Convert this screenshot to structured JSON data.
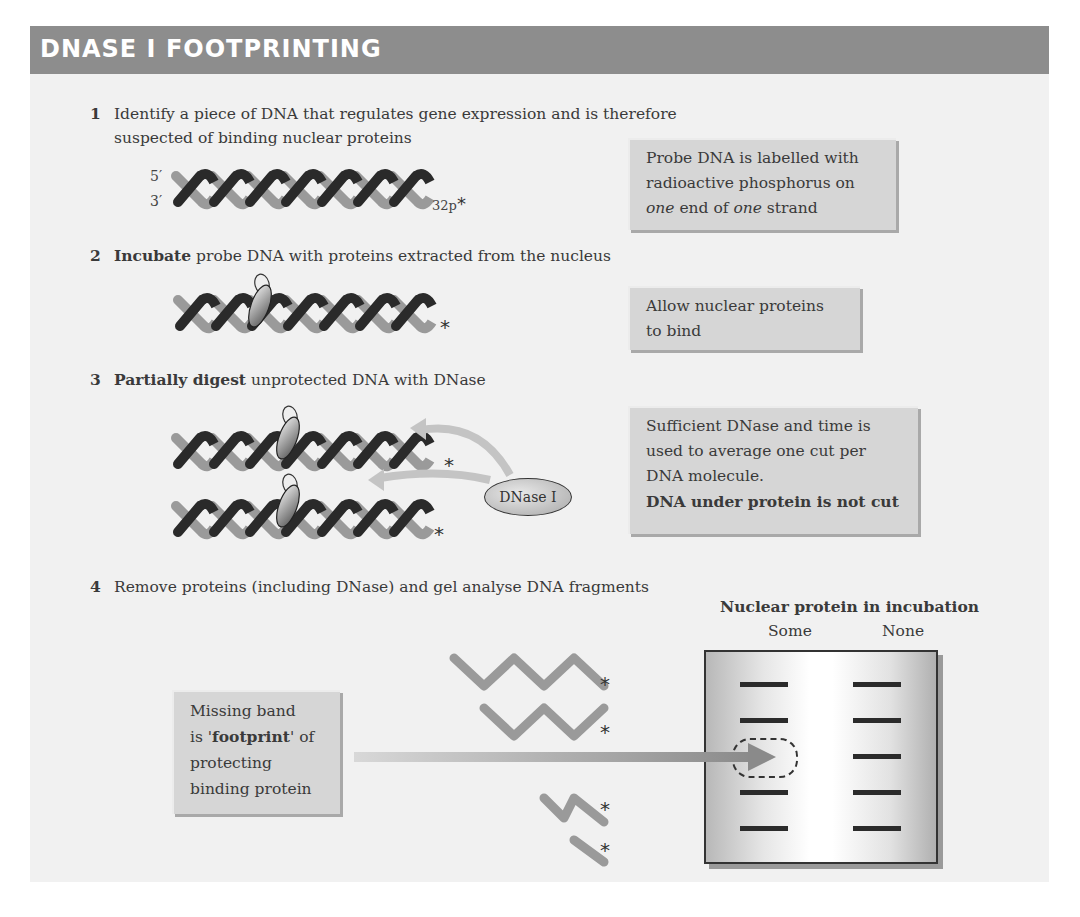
{
  "title": "DNASE I FOOTPRINTING",
  "steps": [
    {
      "num": "1",
      "bold": "",
      "text_line1": "Identify a piece of DNA that regulates gene expression and is therefore",
      "text_line2": "suspected of binding nuclear proteins"
    },
    {
      "num": "2",
      "bold": "Incubate",
      "text": " probe DNA with proteins extracted from the nucleus"
    },
    {
      "num": "3",
      "bold": "Partially digest",
      "text": " unprotected DNA with DNase"
    },
    {
      "num": "4",
      "bold": "",
      "text": "Remove proteins (including DNase) and gel analyse DNA fragments"
    }
  ],
  "notes": {
    "probe": {
      "line1": "Probe DNA is labelled with",
      "line2": "radioactive phosphorus on",
      "line3_italic_a": "one",
      "line3_mid": " end of ",
      "line3_italic_b": "one",
      "line3_end": " strand"
    },
    "bind": {
      "line1": "Allow nuclear proteins",
      "line2": "to bind"
    },
    "dnase": {
      "line1": "Sufficient DNase and time is",
      "line2": "used to average one cut per",
      "line3": "DNA molecule.",
      "line4_bold": "DNA under protein is not cut"
    },
    "footprint": {
      "line1": "Missing band",
      "line2_pre": "is '",
      "line2_bold": "footprint",
      "line2_post": "' of",
      "line3": "protecting",
      "line4": "binding protein"
    }
  },
  "labels": {
    "five_prime": "5′",
    "three_prime": "3′",
    "radiolabel": "32p",
    "asterisk": "*",
    "enzyme": "DNase I"
  },
  "gel": {
    "title": "Nuclear protein in incubation",
    "columns": [
      "Some",
      "None"
    ],
    "lanes": {
      "some": [
        true,
        true,
        false,
        true,
        true
      ],
      "none": [
        true,
        true,
        true,
        true,
        true
      ]
    }
  },
  "colors": {
    "title_bar": "#8d8d8d",
    "panel": "#f1f1f1",
    "strand_dark": "#2a2a2a",
    "strand_light": "#9a9a9a",
    "note_bg": "#d6d6d6"
  }
}
